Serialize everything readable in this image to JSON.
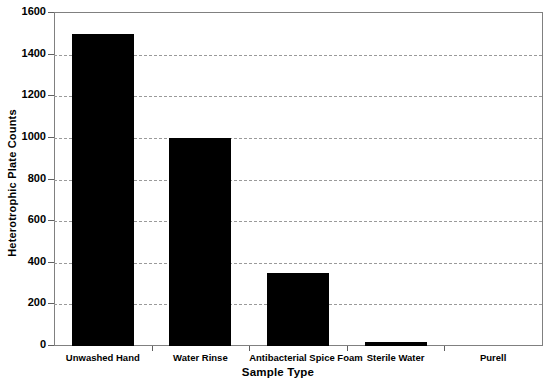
{
  "chart_data": {
    "type": "bar",
    "title": "",
    "xlabel": "Sample Type",
    "ylabel": "Heterotrophic Plate Counts",
    "categories": [
      "Unwashed Hand",
      "Water Rinse",
      "Antibacterial Spice Foam",
      "Sterile Water",
      "Purell"
    ],
    "values": [
      1500,
      1000,
      350,
      20,
      0
    ],
    "ylim": [
      0,
      1600
    ],
    "ytick_labels": [
      "0",
      "200",
      "400",
      "600",
      "800",
      "1000",
      "1200",
      "1400",
      "1600"
    ],
    "ytick_values": [
      0,
      200,
      400,
      600,
      800,
      1000,
      1200,
      1400,
      1600
    ],
    "grid": true,
    "grid_axis": "y",
    "grid_style": "dashed",
    "legend": false,
    "bar_color": "#000000",
    "grid_color": "#9a9a9a",
    "axis_color": "#808080",
    "background_color": "#ffffff"
  }
}
